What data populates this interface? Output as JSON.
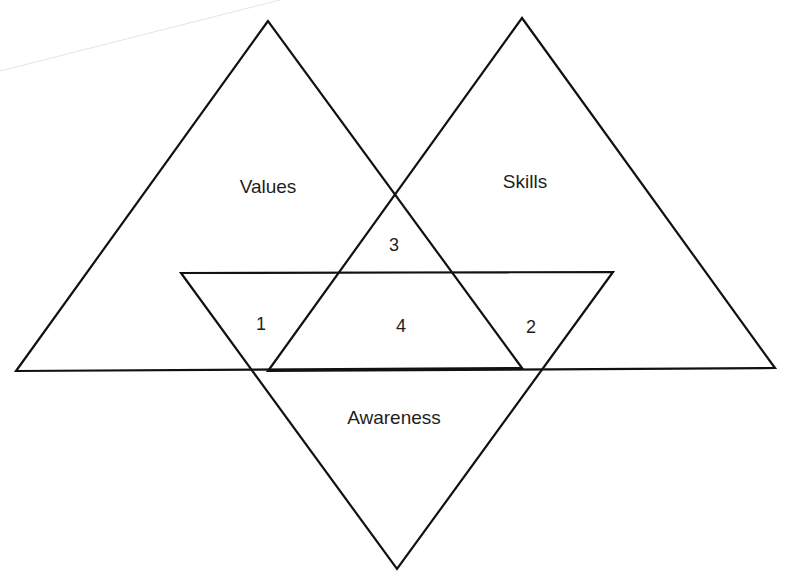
{
  "diagram": {
    "type": "three-triangle overlap (Venn-style) diagram",
    "stroke_color": "#111111",
    "background_color": "#ffffff",
    "triangles": {
      "values": {
        "label": "Values",
        "points": "268,21 16,371 522,368"
      },
      "skills": {
        "label": "Skills",
        "points": "522,18 268,371 775,368"
      },
      "awareness": {
        "label": "Awareness",
        "points": "181,273 613,272 397,569"
      }
    },
    "base_line": "16,371 775,368",
    "artifact_line": {
      "x1": 0,
      "y1": 71,
      "x2": 280,
      "y2": 0
    },
    "region_labels": {
      "one": "1",
      "two": "2",
      "three": "3",
      "four": "4"
    },
    "region_meanings": {
      "1": "Values ∩ Awareness",
      "2": "Skills ∩ Awareness",
      "3": "Values ∩ Skills",
      "4": "Values ∩ Skills ∩ Awareness"
    }
  }
}
